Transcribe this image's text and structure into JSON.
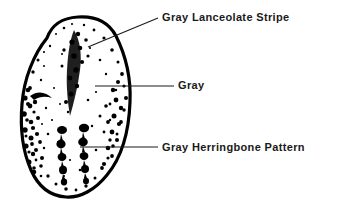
{
  "figure": {
    "type": "labeled-illustration",
    "background_color": "#ffffff",
    "ink_color": "#000000",
    "text_color": "#1a1a1a",
    "egg": {
      "outline": "thick black irregular oval with flattened truncated top and broadly rounded base",
      "fill": "white with dense black stipple speckling",
      "markings": [
        "gray lanceolate stripe down the upper center",
        "gray stippling scattered over the shell",
        "gray herringbone pattern of paired dark blotch chains in the lower half"
      ]
    },
    "callouts": [
      {
        "id": "lanceolate",
        "label": "Gray Lanceolate Stripe",
        "leader": "diagonal line from label down-left to the upper center of the egg"
      },
      {
        "id": "gray",
        "label": "Gray",
        "leader": "horizontal line from label left to the mid-right of the egg"
      },
      {
        "id": "herringbone",
        "label": "Gray Herringbone Pattern",
        "leader": "horizontal line from label left into the lower center of the egg"
      }
    ]
  }
}
